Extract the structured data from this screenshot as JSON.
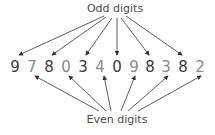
{
  "diagram": {
    "top_label": "Odd digits",
    "bottom_label": "Even digits",
    "digits": [
      "9",
      "7",
      "8",
      "0",
      "3",
      "4",
      "0",
      "9",
      "8",
      "3",
      "8",
      "2"
    ],
    "digit_x": [
      15,
      32,
      49,
      66,
      83,
      100,
      117,
      134,
      150,
      166,
      183,
      200
    ],
    "odd_position_color": "#3a3a3a",
    "even_position_color": "#8a8a8a",
    "arrow_color": "#333333"
  }
}
